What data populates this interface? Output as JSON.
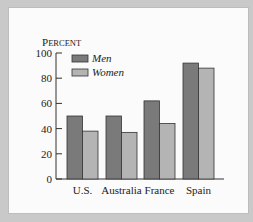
{
  "chart_data": {
    "type": "bar",
    "title": "",
    "ylabel": "Percent",
    "xlabel": "",
    "categories": [
      "U.S.",
      "Australia",
      "France",
      "Spain"
    ],
    "series": [
      {
        "name": "Men",
        "values": [
          50,
          50,
          62,
          92
        ],
        "color": "#7a7a7a"
      },
      {
        "name": "Women",
        "values": [
          38,
          37,
          44,
          88
        ],
        "color": "#b4b4b4"
      }
    ],
    "yticks": [
      0,
      20,
      40,
      60,
      80,
      100
    ],
    "ylim": [
      0,
      100
    ],
    "grid": false,
    "legend_position": "top-left"
  }
}
